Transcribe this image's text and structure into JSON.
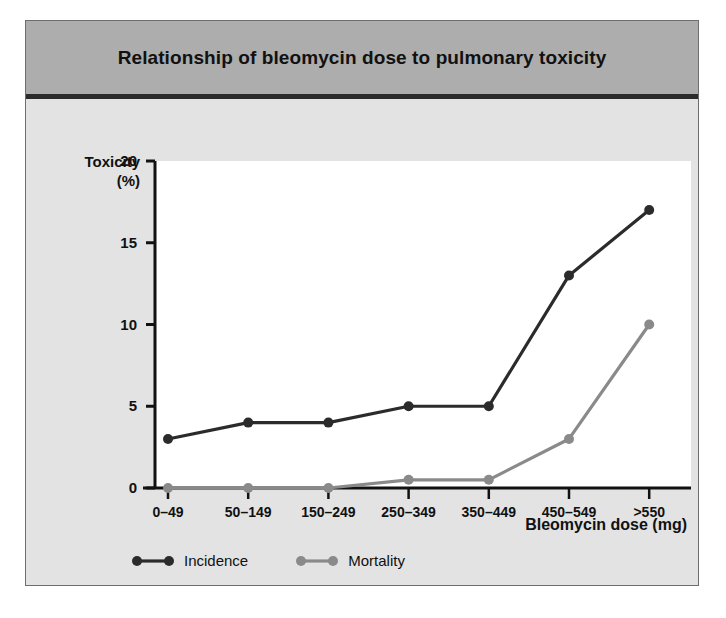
{
  "figure": {
    "title": "Relationship of bleomycin dose to pulmonary toxicity"
  },
  "chart_data": {
    "type": "line",
    "title": "Relationship of bleomycin dose to pulmonary toxicity",
    "xlabel": "Bleomycin dose (mg)",
    "ylabel": "Toxicity",
    "ylabel_units": "(%)",
    "categories": [
      "0–49",
      "50–149",
      "150–249",
      "250–349",
      "350–449",
      "450–549",
      ">550"
    ],
    "ylim": [
      0,
      20
    ],
    "yticks": [
      0,
      5,
      10,
      15,
      20
    ],
    "ytick_labels": [
      "0",
      "5",
      "10",
      "15",
      "20"
    ],
    "grid": false,
    "legend_position": "bottom",
    "series": [
      {
        "name": "Incidence",
        "color": "#2b2b2b",
        "values": [
          3,
          4,
          4,
          5,
          5,
          13,
          17
        ]
      },
      {
        "name": "Mortality",
        "color": "#8a8a8a",
        "values": [
          0,
          0,
          0,
          0.5,
          0.5,
          3,
          10
        ]
      }
    ]
  },
  "legend": {
    "items": [
      {
        "label": "Incidence",
        "color": "#2b2b2b"
      },
      {
        "label": "Mortality",
        "color": "#8a8a8a"
      }
    ]
  },
  "colors": {
    "card_background": "#e3e3e3",
    "title_background": "#adadad",
    "plot_background": "#ffffff",
    "axis": "#111111",
    "incidence": "#2b2b2b",
    "mortality": "#8a8a8a"
  }
}
